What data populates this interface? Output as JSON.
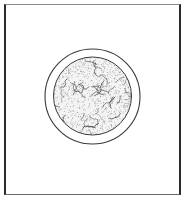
{
  "figure": {
    "frame": {
      "x": 4,
      "y": 4,
      "width": 177,
      "height": 191
    },
    "colors": {
      "background": "#ffffff",
      "line": "#3a3a3a",
      "stipple": "#555555",
      "squiggle": "#2f2f2f"
    },
    "outer_ring": {
      "cx": 92.5,
      "cy": 96.5,
      "r": 47.5,
      "stroke_width": 1.1
    },
    "inner_disc": {
      "cx": 92.5,
      "cy": 96,
      "r": 39,
      "stroke_width": 1.0
    },
    "texture": {
      "type": "stipple-with-squiggles",
      "stipple_density": 900,
      "squiggle_count": 38,
      "seed": 7
    }
  }
}
